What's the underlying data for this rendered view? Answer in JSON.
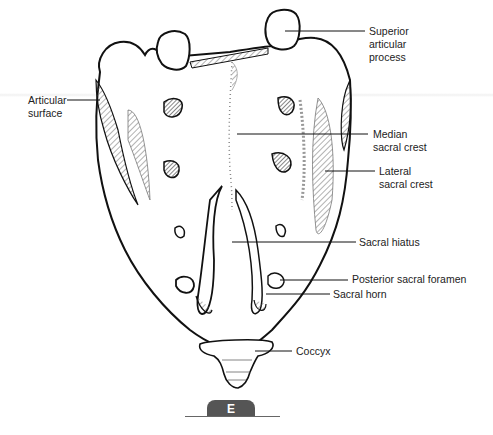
{
  "figure": {
    "panel_letter": "E"
  },
  "labels": [
    {
      "id": "superior-articular-process",
      "lines": [
        "Superior",
        "articular",
        "process"
      ]
    },
    {
      "id": "articular-surface",
      "lines": [
        "Articular",
        "surface"
      ]
    },
    {
      "id": "median-sacral-crest",
      "lines": [
        "Median",
        "sacral crest"
      ]
    },
    {
      "id": "lateral-sacral-crest",
      "lines": [
        "Lateral",
        "sacral crest"
      ]
    },
    {
      "id": "sacral-hiatus",
      "lines": [
        "Sacral hiatus"
      ]
    },
    {
      "id": "posterior-sacral-foramen",
      "lines": [
        "Posterior sacral foramen"
      ]
    },
    {
      "id": "sacral-horn",
      "lines": [
        "Sacral horn"
      ]
    },
    {
      "id": "coccyx",
      "lines": [
        "Coccyx"
      ]
    }
  ]
}
